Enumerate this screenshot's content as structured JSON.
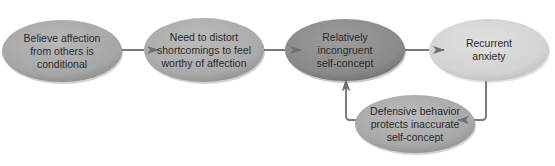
{
  "diagram": {
    "nodes": [
      {
        "id": "n1",
        "label": "Believe affection\nfrom others is\nconditional",
        "cx": 62,
        "cy": 51,
        "rx": 60,
        "ry": 31,
        "fill": "#a8a8a8",
        "shade": "#8e8e8e"
      },
      {
        "id": "n2",
        "label": "Need to distort\nshortcomings to feel\nworthy of affection",
        "cx": 204,
        "cy": 50,
        "rx": 60,
        "ry": 32,
        "fill": "#acacac",
        "shade": "#919191"
      },
      {
        "id": "n3",
        "label": "Relatively\nincongruent\nself-concept",
        "cx": 345,
        "cy": 50,
        "rx": 60,
        "ry": 31,
        "fill": "#8d8d8d",
        "shade": "#747474"
      },
      {
        "id": "n4",
        "label": "Recurrent\nanxiety",
        "cx": 489,
        "cy": 50,
        "rx": 60,
        "ry": 31,
        "fill": "#d5d5d5",
        "shade": "#c3c3c3"
      },
      {
        "id": "n5",
        "label": "Defensive behavior\nprotects inaccurate\nself-concept",
        "cx": 415,
        "cy": 124,
        "rx": 60,
        "ry": 29,
        "fill": "#ababab",
        "shade": "#909090"
      }
    ],
    "edges": [
      {
        "from": "n1",
        "to": "n2"
      },
      {
        "from": "n2",
        "to": "n3"
      },
      {
        "from": "n3",
        "to": "n4"
      },
      {
        "from": "n4",
        "to": "n5"
      },
      {
        "from": "n5",
        "to": "n3"
      }
    ],
    "colors": {
      "connector": "#7a7a7a",
      "text": "#2b2b2b",
      "background": "#ffffff"
    }
  }
}
